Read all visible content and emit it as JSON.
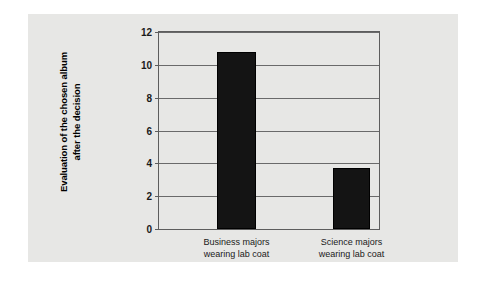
{
  "chart_data": {
    "type": "bar",
    "title": "",
    "xlabel": "",
    "ylabel": "Evaluation of the chosen album after the decision",
    "ylabel_lines": [
      "Evaluation of the chosen album",
      "after the decision"
    ],
    "categories": [
      "Business majors wearing lab coat",
      "Science majors wearing lab coat"
    ],
    "category_lines": [
      [
        "Business majors",
        "wearing lab coat"
      ],
      [
        "Science majors",
        "wearing lab coat"
      ]
    ],
    "values": [
      10.8,
      3.7
    ],
    "ylim": [
      0,
      12
    ],
    "yticks": [
      0,
      2,
      4,
      6,
      8,
      10,
      12
    ],
    "ytick_labels": [
      "0",
      "2",
      "4",
      "6",
      "8",
      "10",
      "12"
    ],
    "grid": true,
    "grid_axis": "y",
    "legend": false,
    "bar_color": "#141414",
    "plot_background": "#e7e7e5",
    "page_background": "#ffffff",
    "axis_color": "#5d5d5d",
    "gridline_color": "#6a6a6a"
  }
}
